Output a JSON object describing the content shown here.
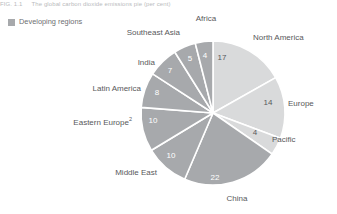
{
  "figure": {
    "caption_number": "FIG. 1.1",
    "caption_text": "The global carbon dioxide emissions pie (per cent)"
  },
  "legend": {
    "items": [
      {
        "label": "Developing regions",
        "color": "#a7a9ac",
        "icon": "legend-swatch"
      }
    ]
  },
  "chart_data": {
    "type": "pie",
    "title": "",
    "subtitle": "",
    "xlabel": "",
    "ylabel": "",
    "units": "per cent",
    "legend_position": "top-left",
    "grid": false,
    "total": 101,
    "start_angle_deg": -90,
    "direction": "clockwise",
    "categories": [
      "North America",
      "Europe",
      "Pacific",
      "China",
      "Middle East",
      "Eastern Europe",
      "Latin America",
      "India",
      "Southeast Asia",
      "Africa"
    ],
    "values": [
      17,
      14,
      4,
      22,
      10,
      10,
      8,
      7,
      5,
      4
    ],
    "slices": [
      {
        "name": "North America",
        "label": "North America",
        "value": 17,
        "value_text": "17",
        "group": "developed",
        "color": "#d9dadb",
        "value_color": "#58595b",
        "label_x": 253,
        "label_y": 37,
        "value_x": 222,
        "value_y": 58,
        "label_anchor": "start"
      },
      {
        "name": "Europe",
        "label": "Europe",
        "value": 14,
        "value_text": "14",
        "group": "developed",
        "color": "#d9dadb",
        "value_color": "#58595b",
        "label_x": 288,
        "label_y": 103,
        "value_x": 268,
        "value_y": 103,
        "label_anchor": "start"
      },
      {
        "name": "Pacific",
        "label": "Pacific",
        "value": 4,
        "value_text": "4",
        "group": "developed",
        "color": "#d9dadb",
        "value_color": "#58595b",
        "label_x": 272,
        "label_y": 139,
        "value_x": 255,
        "value_y": 133,
        "label_anchor": "start"
      },
      {
        "name": "China",
        "label": "China",
        "value": 22,
        "value_text": "22",
        "group": "developing",
        "color": "#a7a9ac",
        "value_color": "#ffffff",
        "label_x": 237,
        "label_y": 198,
        "value_x": 215,
        "value_y": 178,
        "label_anchor": "mid"
      },
      {
        "name": "Middle East",
        "label": "Middle East",
        "value": 10,
        "value_text": "10",
        "group": "developing",
        "color": "#a7a9ac",
        "value_color": "#ffffff",
        "label_x": 157,
        "label_y": 172,
        "value_x": 171,
        "value_y": 156,
        "label_anchor": "end"
      },
      {
        "name": "Eastern Europe",
        "label": "Eastern Europe",
        "value": 10,
        "value_text": "10",
        "group": "developing",
        "color": "#a7a9ac",
        "value_color": "#ffffff",
        "footnote": "2",
        "label_x": 132,
        "label_y": 122,
        "value_x": 153,
        "value_y": 121,
        "label_anchor": "end"
      },
      {
        "name": "Latin America",
        "label": "Latin America",
        "value": 8,
        "value_text": "8",
        "group": "developing",
        "color": "#a7a9ac",
        "value_color": "#ffffff",
        "label_x": 141,
        "label_y": 88,
        "value_x": 157,
        "value_y": 93,
        "label_anchor": "end"
      },
      {
        "name": "India",
        "label": "India",
        "value": 7,
        "value_text": "7",
        "group": "developing",
        "color": "#a7a9ac",
        "value_color": "#ffffff",
        "label_x": 155,
        "label_y": 62,
        "value_x": 170,
        "value_y": 71,
        "label_anchor": "end"
      },
      {
        "name": "Southeast Asia",
        "label": "Southeast Asia",
        "value": 5,
        "value_text": "5",
        "group": "developing",
        "color": "#a7a9ac",
        "value_color": "#ffffff",
        "label_x": 180,
        "label_y": 32,
        "value_x": 190,
        "value_y": 59,
        "label_anchor": "end"
      },
      {
        "name": "Africa",
        "label": "Africa",
        "value": 4,
        "value_text": "4",
        "group": "developing",
        "color": "#a7a9ac",
        "value_color": "#ffffff",
        "label_x": 206,
        "label_y": 18,
        "value_x": 205,
        "value_y": 56,
        "label_anchor": "mid"
      }
    ],
    "geometry": {
      "cx": 213,
      "cy": 113,
      "r": 72
    },
    "colors": {
      "developed": "#d9dadb",
      "developing": "#a7a9ac",
      "separator": "#ffffff",
      "text": "#58595b"
    }
  }
}
